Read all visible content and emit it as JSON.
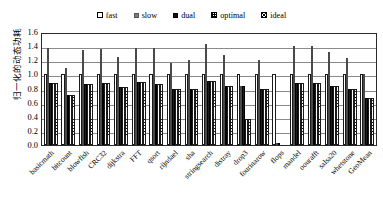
{
  "chart_data": {
    "type": "bar",
    "title": "",
    "xlabel": "",
    "ylabel": "归一化的动态功耗",
    "ylim": [
      0.0,
      1.6
    ],
    "yticks": [
      "0.0",
      "0.2",
      "0.4",
      "0.6",
      "0.8",
      "1.0",
      "1.2",
      "1.4",
      "1.6"
    ],
    "ytick_values": [
      0.0,
      0.2,
      0.4,
      0.6,
      0.8,
      1.0,
      1.2,
      1.4,
      1.6
    ],
    "grid": true,
    "legend_position": "top-center",
    "categories": [
      "basicmath",
      "bitcount",
      "blowfish",
      "CRC32",
      "dijkstra",
      "FFT",
      "qsort",
      "rijndael",
      "sha",
      "stringsearch",
      "distray",
      "drop3",
      "fourinarow",
      "flops",
      "mandel",
      "oourafft",
      "salsa20",
      "whetstone",
      "GeoMean"
    ],
    "series": [
      {
        "name": "fast",
        "color": "#ffffff",
        "pattern": "solid-white",
        "values": [
          1.0,
          1.0,
          1.0,
          1.0,
          1.0,
          1.0,
          1.0,
          1.0,
          1.0,
          1.0,
          1.0,
          1.0,
          1.0,
          1.0,
          1.0,
          1.0,
          1.0,
          1.0,
          1.0
        ]
      },
      {
        "name": "slow",
        "color": "#8c8c8c",
        "pattern": "solid-gray",
        "values": [
          1.38,
          1.09,
          1.35,
          1.36,
          1.25,
          1.38,
          1.37,
          1.16,
          1.21,
          1.43,
          1.27,
          0.83,
          1.21,
          0.02,
          1.4,
          1.4,
          1.31,
          1.23,
          1.0
        ]
      },
      {
        "name": "dual",
        "color": "#1c1c1c",
        "pattern": "solid-black",
        "values": [
          0.88,
          0.71,
          0.87,
          0.88,
          0.82,
          0.89,
          0.86,
          0.8,
          0.8,
          0.91,
          0.83,
          0.83,
          0.8,
          0.02,
          0.88,
          0.88,
          0.83,
          0.8,
          0.67
        ]
      },
      {
        "name": "optimal",
        "color": "#ffffff",
        "pattern": "grid-dots",
        "values": [
          0.88,
          0.71,
          0.87,
          0.88,
          0.82,
          0.89,
          0.86,
          0.8,
          0.8,
          0.91,
          0.83,
          0.37,
          0.8,
          0.0,
          0.88,
          0.88,
          0.83,
          0.8,
          0.67
        ]
      },
      {
        "name": "ideal",
        "color": "#ffffff",
        "pattern": "cross-hatch",
        "values": [
          0.88,
          0.71,
          0.87,
          0.88,
          0.82,
          0.89,
          0.86,
          0.8,
          0.8,
          0.91,
          0.83,
          0.37,
          0.8,
          0.0,
          0.88,
          0.88,
          0.83,
          0.8,
          0.67
        ]
      }
    ]
  },
  "legend": {
    "items": [
      {
        "label": "fast",
        "swatch": "legend-swatch-fast"
      },
      {
        "label": "slow",
        "swatch": "legend-swatch-slow"
      },
      {
        "label": "dual",
        "swatch": "legend-swatch-dual"
      },
      {
        "label": "optimal",
        "swatch": "legend-swatch-optimal"
      },
      {
        "label": "ideal",
        "swatch": "legend-swatch-ideal"
      }
    ]
  }
}
